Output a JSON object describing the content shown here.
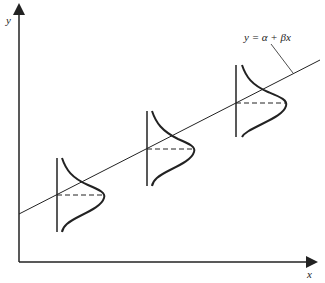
{
  "diagram": {
    "type": "regression-with-conditional-distributions",
    "equation_label": "y = α + βx",
    "axes": {
      "x_label": "x",
      "y_label": "y"
    },
    "colors": {
      "line": "#222222",
      "background": "#ffffff"
    },
    "distributions": [
      {
        "name": "left",
        "x_position": 57,
        "mean_y": 195
      },
      {
        "name": "middle",
        "x_position": 147,
        "mean_y": 149
      },
      {
        "name": "right",
        "x_position": 236,
        "mean_y": 103
      }
    ]
  }
}
